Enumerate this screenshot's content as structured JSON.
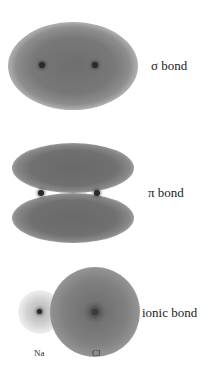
{
  "diagram": {
    "type": "chemical-bond-electron-density",
    "panels": [
      {
        "id": "sigma",
        "label": "σ bond",
        "nuclei_count": 2,
        "cloud_shape": "single ellipse enclosing both nuclei"
      },
      {
        "id": "pi",
        "label": "π bond",
        "nuclei_count": 2,
        "cloud_shape": "two lobes above and below internuclear axis"
      },
      {
        "id": "ionic",
        "label": "ionic bond",
        "nuclei_count": 2,
        "cloud_shape": "small faint cloud on Na, large dense cloud on Cl",
        "atom_labels": [
          "Na",
          "Cl"
        ]
      }
    ]
  },
  "colors": {
    "background": "#ffffff",
    "cloud": "#787878",
    "nucleus": "#2a2a2a",
    "text": "#222222"
  }
}
